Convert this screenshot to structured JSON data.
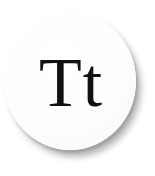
{
  "icon": {
    "label": "Tt",
    "semantic": "text-format-icon",
    "colors": {
      "background": "#ffffff",
      "circle": "#ffffff",
      "text": "#111111",
      "shadow": "rgba(0,0,0,0.28)"
    }
  }
}
